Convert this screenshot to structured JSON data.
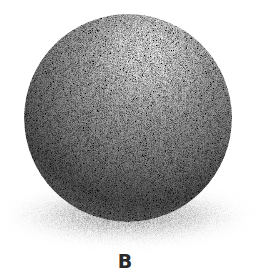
{
  "figure": {
    "label": "B",
    "colors": {
      "background": "#ffffff",
      "highlight": "#ffffff",
      "midtone": "#9a9a9a",
      "core_shadow": "#3a3a3a",
      "cast_shadow": "#5a5a5a",
      "label": "#2a2a2a"
    }
  }
}
